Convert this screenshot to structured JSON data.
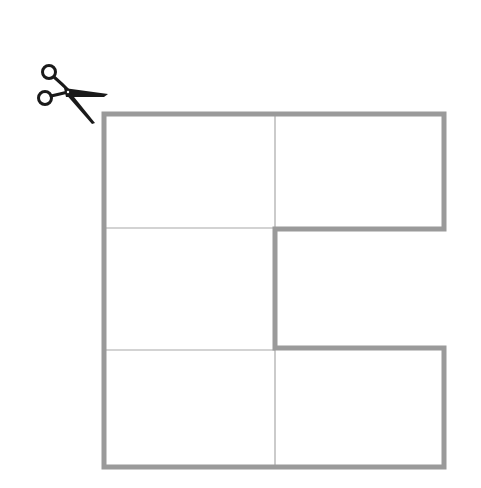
{
  "diagram": {
    "title": "",
    "colors": {
      "background": "#ffffff",
      "outline": "#9a9a9a",
      "inner_lines": "#a8a8a8",
      "scissors": "#1a1a1a"
    },
    "icon": "scissors-icon",
    "outline_points": [
      [
        104,
        114
      ],
      [
        444,
        114
      ],
      [
        444,
        229
      ],
      [
        275,
        229
      ],
      [
        275,
        348
      ],
      [
        444,
        348
      ],
      [
        444,
        467
      ],
      [
        104,
        467
      ]
    ],
    "inner_lines": [
      {
        "x1": 275,
        "y1": 114,
        "x2": 275,
        "y2": 229
      },
      {
        "x1": 104,
        "y1": 228,
        "x2": 275,
        "y2": 228
      },
      {
        "x1": 104,
        "y1": 350,
        "x2": 275,
        "y2": 350
      },
      {
        "x1": 275,
        "y1": 348,
        "x2": 275,
        "y2": 467
      }
    ],
    "cells": [
      {
        "id": "top-left",
        "row": 1,
        "col": 1
      },
      {
        "id": "top-right",
        "row": 1,
        "col": 2
      },
      {
        "id": "middle-left",
        "row": 2,
        "col": 1
      },
      {
        "id": "bottom-left",
        "row": 3,
        "col": 1
      },
      {
        "id": "bottom-right",
        "row": 3,
        "col": 2
      }
    ]
  }
}
